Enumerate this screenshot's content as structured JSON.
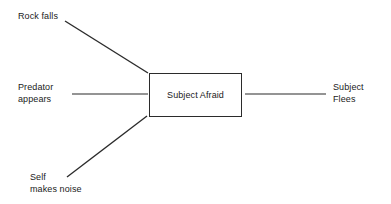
{
  "diagram": {
    "type": "cause-effect",
    "background_color": "#ffffff",
    "line_color": "#2b2b2b",
    "text_color": "#1a1a1a",
    "width": 391,
    "height": 204,
    "center_node": {
      "id": "subject-afraid",
      "label": "Subject Afraid",
      "shape": "rectangle",
      "x": 149,
      "y": 73,
      "width": 93,
      "height": 44
    },
    "cause_nodes": [
      {
        "id": "rock-falls",
        "label": "Rock falls",
        "lines": [
          "Rock falls"
        ],
        "x": 18,
        "y": 10
      },
      {
        "id": "predator-appears",
        "label": "Predator appears",
        "lines": [
          "Predator",
          "appears"
        ],
        "x": 18,
        "y": 81
      },
      {
        "id": "self-makes-noise",
        "label": "Self makes noise",
        "lines": [
          "Self",
          "makes noise"
        ],
        "x": 30,
        "y": 171
      }
    ],
    "effect_nodes": [
      {
        "id": "subject-flees",
        "label": "Subject Flees",
        "lines": [
          "Subject",
          "Flees"
        ],
        "x": 333,
        "y": 81
      }
    ],
    "connectors": [
      {
        "id": "rock-falls-to-center",
        "from": "rock-falls",
        "to": "subject-afraid",
        "x1": 65,
        "y1": 21,
        "x2": 148,
        "y2": 73,
        "style": "diagonal"
      },
      {
        "id": "predator-to-center",
        "from": "predator-appears",
        "to": "subject-afraid",
        "x1": 72,
        "y1": 94,
        "x2": 148,
        "y2": 94,
        "style": "horizontal"
      },
      {
        "id": "self-noise-to-center",
        "from": "self-makes-noise",
        "to": "subject-afraid",
        "x1": 67,
        "y1": 177,
        "x2": 147,
        "y2": 116,
        "style": "diagonal"
      },
      {
        "id": "center-to-subject-flees",
        "from": "subject-afraid",
        "to": "subject-flees",
        "x1": 245,
        "y1": 94,
        "x2": 326,
        "y2": 94,
        "style": "horizontal"
      }
    ]
  },
  "labels": {
    "rock_falls": "Rock falls",
    "predator_appears": "Predator\nappears",
    "self_makes_noise": "Self\nmakes noise",
    "subject_afraid": "Subject Afraid",
    "subject_flees": "Subject\nFlees"
  }
}
